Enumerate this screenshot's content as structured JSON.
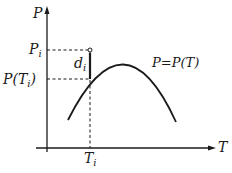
{
  "diagram": {
    "axes": {
      "y_label": "P",
      "x_label": "T"
    },
    "labels": {
      "p_i": {
        "main": "P",
        "sub": "i"
      },
      "p_t_i": {
        "prefix": "P(T",
        "sub": "i",
        "suffix": ")"
      },
      "d_i": {
        "main": "d",
        "sub": "i"
      },
      "t_i": {
        "main": "T",
        "sub": "i"
      },
      "curve": "P=P(T)"
    },
    "colors": {
      "line": "#1a1a1a",
      "background": "#ffffff"
    }
  }
}
